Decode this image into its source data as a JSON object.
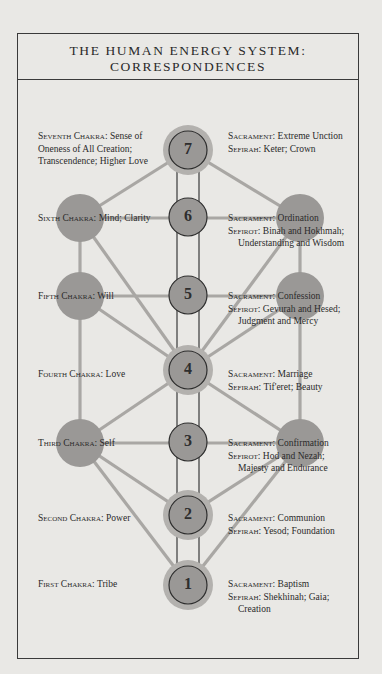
{
  "title": {
    "line1": "THE HUMAN ENERGY SYSTEM:",
    "line2": "CORRESPONDENCES"
  },
  "colors": {
    "background": "#e9e8e5",
    "circle_fill": "#9a9896",
    "halo": "#b3b1ae",
    "line": "#a9a7a4",
    "stroke": "#2e2e2e"
  },
  "chakras": [
    {
      "number": "7",
      "name_label": "Seventh Chakra:",
      "meaning": [
        " Sense of",
        "Oneness of All Creation;",
        "Transcendence; Higher Love"
      ],
      "sacrament_label": "Sacrament:",
      "sacrament": " Extreme Unction",
      "sefira_label": "Sefirah:",
      "sefira": [
        " Keter; Crown"
      ]
    },
    {
      "number": "6",
      "name_label": "Sixth Chakra:",
      "meaning": [
        " Mind; Clarity"
      ],
      "sacrament_label": "Sacrament:",
      "sacrament": " Ordination",
      "sefira_label": "Sefirot:",
      "sefira": [
        " Binah and Hokhmah;",
        "Understanding and Wisdom"
      ]
    },
    {
      "number": "5",
      "name_label": "Fifth Chakra:",
      "meaning": [
        " Will"
      ],
      "sacrament_label": "Sacrament:",
      "sacrament": " Confession",
      "sefira_label": "Sefirot:",
      "sefira": [
        " Gevurah and Hesed;",
        "Judgment and Mercy"
      ]
    },
    {
      "number": "4",
      "name_label": "Fourth Chakra:",
      "meaning": [
        " Love"
      ],
      "sacrament_label": "Sacrament:",
      "sacrament": " Marriage",
      "sefira_label": "Sefirah:",
      "sefira": [
        " Tif'eret; Beauty"
      ]
    },
    {
      "number": "3",
      "name_label": "Third Chakra:",
      "meaning": [
        " Self"
      ],
      "sacrament_label": "Sacrament:",
      "sacrament": " Confirmation",
      "sefira_label": "Sefirot:",
      "sefira": [
        " Hod and Nezah;",
        "Majesty and Endurance"
      ]
    },
    {
      "number": "2",
      "name_label": "Second Chakra:",
      "meaning": [
        " Power"
      ],
      "sacrament_label": "Sacrament:",
      "sacrament": " Communion",
      "sefira_label": "Sefirah:",
      "sefira": [
        " Yesod; Foundation"
      ]
    },
    {
      "number": "1",
      "name_label": "First Chakra:",
      "meaning": [
        " Tribe"
      ],
      "sacrament_label": "Sacrament:",
      "sacrament": " Baptism",
      "sefira_label": "Sefirah:",
      "sefira": [
        " Shekhinah; Gaia;",
        "Creation"
      ]
    }
  ]
}
